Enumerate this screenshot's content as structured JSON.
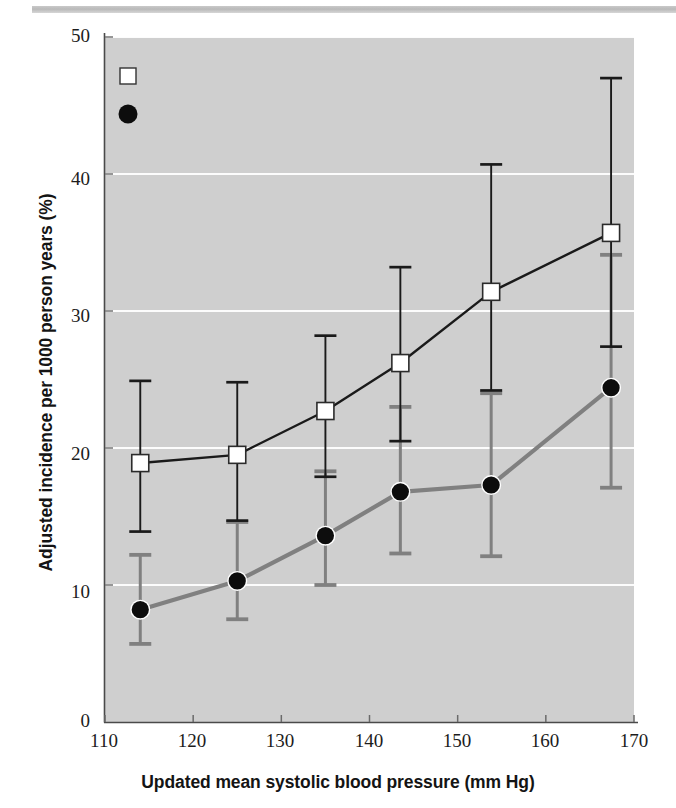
{
  "chart_data": {
    "type": "line",
    "title": "",
    "xlabel": "Updated mean systolic blood pressure (mm Hg)",
    "ylabel": "Adjusted incidence per 1000 person years (%)",
    "xlim": [
      110,
      170
    ],
    "ylim": [
      0,
      50
    ],
    "xticks": [
      110,
      120,
      130,
      140,
      150,
      160,
      170
    ],
    "yticks": [
      0,
      10,
      20,
      30,
      40,
      50
    ],
    "grid": "horizontal-white",
    "legend_position": "top-left",
    "plot_background": "#cfcfcf",
    "series": [
      {
        "name": "Myocardial infarction",
        "marker": "open-square",
        "color": "#1a1a1a",
        "x": [
          114,
          125,
          135,
          143.5,
          153.8,
          167.4
        ],
        "values": [
          18.9,
          19.5,
          22.7,
          26.2,
          31.4,
          35.7
        ],
        "err_low": [
          13.9,
          14.7,
          17.9,
          20.5,
          24.2,
          27.4
        ],
        "err_high": [
          24.9,
          24.8,
          28.2,
          33.2,
          40.7,
          47.0
        ]
      },
      {
        "name": "Microvascular end points",
        "marker": "filled-circle",
        "color": "#808080",
        "x": [
          114,
          125,
          135,
          143.5,
          153.8,
          167.4
        ],
        "values": [
          8.2,
          10.3,
          13.6,
          16.8,
          17.3,
          24.4
        ],
        "err_low": [
          5.7,
          7.5,
          10.0,
          12.3,
          12.1,
          17.1
        ],
        "err_high": [
          12.2,
          14.6,
          18.3,
          23.0,
          24.0,
          34.1
        ]
      }
    ],
    "legend": [
      {
        "label": "Myocardial infarction",
        "marker": "open-square"
      },
      {
        "label": "Microvascular end points",
        "marker": "filled-circle"
      }
    ]
  },
  "axis": {
    "y_tick_labels": [
      "50",
      "40",
      "30",
      "20",
      "10",
      "0"
    ],
    "x_tick_labels": [
      "110",
      "120",
      "130",
      "140",
      "150",
      "160",
      "170"
    ]
  }
}
